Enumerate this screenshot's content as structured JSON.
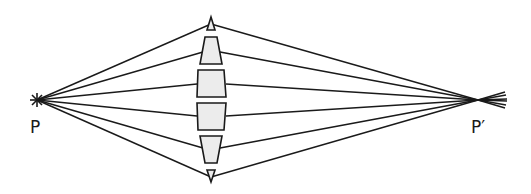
{
  "diagram": {
    "type": "lens-ray-diagram",
    "source_label": "P",
    "image_label": "P′",
    "colors": {
      "line": "#1a1a1a",
      "lens_fill": "#ececec",
      "background": "#ffffff"
    },
    "source_point": {
      "x": 37,
      "y": 100
    },
    "image_point": {
      "x": 478,
      "y": 100
    },
    "lens_center_x": 211,
    "lens_elements": [
      {
        "name": "top-prism-tip",
        "shape": "triangle-up",
        "y_top": 17,
        "y_bottom": 30
      },
      {
        "name": "upper-prism",
        "shape": "trapezoid-narrow-top",
        "y_top": 37,
        "y_bottom": 64
      },
      {
        "name": "upper-block",
        "shape": "block",
        "y_top": 70,
        "y_bottom": 97
      },
      {
        "name": "lower-block",
        "shape": "block",
        "y_top": 103,
        "y_bottom": 130
      },
      {
        "name": "lower-prism",
        "shape": "trapezoid-narrow-bottom",
        "y_top": 136,
        "y_bottom": 163
      },
      {
        "name": "bottom-prism-tip",
        "shape": "triangle-down",
        "y_top": 170,
        "y_bottom": 182
      }
    ],
    "ray_count": 6
  }
}
